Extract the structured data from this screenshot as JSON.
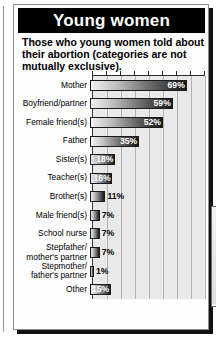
{
  "header": {
    "title": "Young women",
    "subtitle": "Those who young women told about their abortion (categories are not mutually exclusive)."
  },
  "source": {
    "label": "Source: Marie Stopes International"
  },
  "axis": {
    "unit_label": "%",
    "ticks": [
      "0",
      "10",
      "20",
      "30",
      "40",
      "50",
      "60",
      "70",
      "80"
    ]
  },
  "illustration": {
    "name": "woman-embracing-young-woman-illustration"
  },
  "chart_data": {
    "type": "bar",
    "orientation": "horizontal",
    "title": "Young women",
    "subtitle": "Those who young women told about their abortion (categories are not mutually exclusive).",
    "xlabel": "%",
    "ylabel": "",
    "xlim": [
      0,
      80
    ],
    "grid": true,
    "legend": false,
    "source": "Source: Marie Stopes International",
    "categories": [
      "Mother",
      "Boyfriend/partner",
      "Female friend(s)",
      "Father",
      "Sister(s)",
      "Teacher(s)",
      "Brother(s)",
      "Male friend(s)",
      "School nurse",
      "Stepfather/ mother's partner",
      "Stepmother/ father's partner",
      "Other"
    ],
    "values": [
      69,
      59,
      52,
      35,
      18,
      16,
      11,
      7,
      7,
      7,
      1,
      15
    ],
    "data_labels": [
      "69%",
      "59%",
      "52%",
      "35%",
      "18%",
      "16%",
      "11%",
      "7%",
      "7%",
      "7%",
      "1%",
      "15%"
    ]
  },
  "rows": [
    {
      "label_line1": "Mother",
      "label_line2": "",
      "value": 69,
      "display": "69%",
      "label_inside": true
    },
    {
      "label_line1": "Boyfriend/partner",
      "label_line2": "",
      "value": 59,
      "display": "59%",
      "label_inside": true
    },
    {
      "label_line1": "Female friend(s)",
      "label_line2": "",
      "value": 52,
      "display": "52%",
      "label_inside": true
    },
    {
      "label_line1": "Father",
      "label_line2": "",
      "value": 35,
      "display": "35%",
      "label_inside": true
    },
    {
      "label_line1": "Sister(s)",
      "label_line2": "",
      "value": 18,
      "display": "18%",
      "label_inside": true
    },
    {
      "label_line1": "Teacher(s)",
      "label_line2": "",
      "value": 16,
      "display": "16%",
      "label_inside": true
    },
    {
      "label_line1": "Brother(s)",
      "label_line2": "",
      "value": 11,
      "display": "11%",
      "label_inside": false
    },
    {
      "label_line1": "Male friend(s)",
      "label_line2": "",
      "value": 7,
      "display": "7%",
      "label_inside": false
    },
    {
      "label_line1": "School nurse",
      "label_line2": "",
      "value": 7,
      "display": "7%",
      "label_inside": false
    },
    {
      "label_line1": "Stepfather/",
      "label_line2": "mother's partner",
      "value": 7,
      "display": "7%",
      "label_inside": false
    },
    {
      "label_line1": "Stepmother/",
      "label_line2": "father's partner",
      "value": 1,
      "display": "1%",
      "label_inside": false
    },
    {
      "label_line1": "Other",
      "label_line2": "",
      "value": 15,
      "display": "15%",
      "label_inside": true
    }
  ]
}
